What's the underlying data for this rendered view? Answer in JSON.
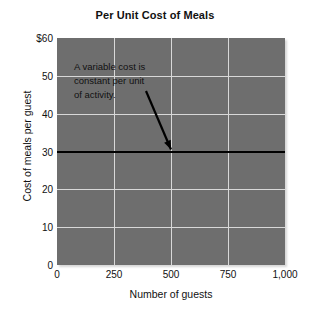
{
  "chart_data": {
    "type": "line",
    "title": "Per Unit Cost of Meals",
    "xlabel": "Number of guests",
    "ylabel": "Cost of meals per guest",
    "xlim": [
      0,
      1000
    ],
    "ylim": [
      0,
      60
    ],
    "grid": true,
    "legend": "none",
    "plot_background": "#6e6e6e",
    "gridline_color": "#d8d8d8",
    "series_color": "#000000",
    "x_ticks": [
      {
        "value": 0,
        "label": "0"
      },
      {
        "value": 250,
        "label": "250"
      },
      {
        "value": 500,
        "label": "500"
      },
      {
        "value": 750,
        "label": "750"
      },
      {
        "value": 1000,
        "label": "1,000"
      }
    ],
    "y_ticks": [
      {
        "value": 60,
        "label": "$60"
      },
      {
        "value": 50,
        "label": "50"
      },
      {
        "value": 40,
        "label": "40"
      },
      {
        "value": 30,
        "label": "30"
      },
      {
        "value": 20,
        "label": "20"
      },
      {
        "value": 10,
        "label": "10"
      },
      {
        "value": 0,
        "label": "0"
      }
    ],
    "series": [
      {
        "name": "Cost of meals per guest",
        "x": [
          0,
          250,
          500,
          750,
          1000
        ],
        "values": [
          30,
          30,
          30,
          30,
          30
        ]
      }
    ],
    "annotations": [
      {
        "lines": [
          "A variable cost is",
          "constant per unit",
          "of activity."
        ],
        "points_to": {
          "x": 500,
          "y": 30
        }
      }
    ]
  }
}
